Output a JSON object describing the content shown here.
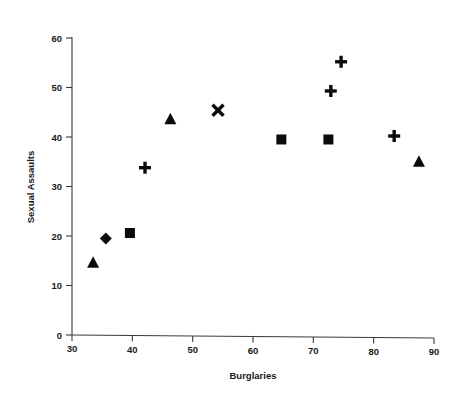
{
  "chart_data": {
    "type": "scatter",
    "title": "",
    "xlabel": "Burglaries",
    "ylabel": "Sexual Assaults",
    "xlim": [
      30,
      90
    ],
    "ylim": [
      0,
      60
    ],
    "xticks": [
      30,
      40,
      50,
      60,
      70,
      80,
      90
    ],
    "yticks": [
      0,
      10,
      20,
      30,
      40,
      50,
      60
    ],
    "grid": false,
    "legend": "none",
    "points": [
      {
        "label": "p1",
        "x": 33.5,
        "y": 14.6,
        "marker": "triangle"
      },
      {
        "label": "p2",
        "x": 35.6,
        "y": 19.5,
        "marker": "diamond"
      },
      {
        "label": "p3",
        "x": 39.6,
        "y": 20.6,
        "marker": "square"
      },
      {
        "label": "p4",
        "x": 42.1,
        "y": 33.8,
        "marker": "plus"
      },
      {
        "label": "p5",
        "x": 46.3,
        "y": 43.6,
        "marker": "triangle"
      },
      {
        "label": "p6",
        "x": 54.2,
        "y": 45.4,
        "marker": "cross"
      },
      {
        "label": "p7",
        "x": 64.7,
        "y": 39.5,
        "marker": "square"
      },
      {
        "label": "p8",
        "x": 72.5,
        "y": 39.5,
        "marker": "square"
      },
      {
        "label": "p9",
        "x": 72.9,
        "y": 49.3,
        "marker": "plus"
      },
      {
        "label": "p10",
        "x": 74.6,
        "y": 55.2,
        "marker": "plus"
      },
      {
        "label": "p11",
        "x": 83.4,
        "y": 40.2,
        "marker": "plus"
      },
      {
        "label": "p12",
        "x": 87.5,
        "y": 35.0,
        "marker": "triangle"
      }
    ]
  },
  "axis": {
    "x_tick_labels": [
      "30",
      "40",
      "50",
      "60",
      "70",
      "80",
      "90"
    ],
    "y_tick_labels": [
      "0",
      "10",
      "20",
      "30",
      "40",
      "50",
      "60"
    ],
    "x_title": "Burglaries",
    "y_title": "Sexual Assaults"
  }
}
